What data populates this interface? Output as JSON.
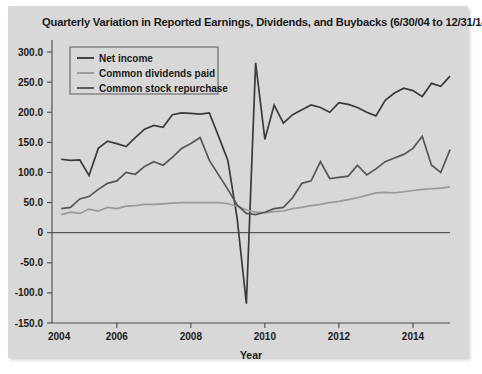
{
  "figure": {
    "background_color": "#ffffff",
    "card_color": "#d8d8d8"
  },
  "chart_data": {
    "type": "line",
    "title": "Quarterly Variation in Reported Earnings, Dividends, and Buybacks (6/30/04 to 12/31/14)",
    "xlabel": "Year",
    "ylabel": "",
    "xlim": [
      2004.25,
      2015.0
    ],
    "ylim": [
      -150,
      320
    ],
    "grid": false,
    "legend_position": "upper left",
    "xticks": [
      2004,
      2006,
      2008,
      2010,
      2012,
      2014
    ],
    "xticklabels": [
      "2004",
      "2006",
      "2008",
      "2010",
      "2012",
      "2014"
    ],
    "yticks": [
      -150,
      -100,
      -50,
      0,
      50,
      100,
      150,
      200,
      250,
      300
    ],
    "yticklabels": [
      "-150.0",
      "-100.0",
      "-50.0",
      "0",
      "50.0",
      "100.0",
      "150.0",
      "200.0",
      "250.0",
      "300.0"
    ],
    "zero_reference_line": 0,
    "x": [
      2004.5,
      2004.75,
      2005.0,
      2005.25,
      2005.5,
      2005.75,
      2006.0,
      2006.25,
      2006.5,
      2006.75,
      2007.0,
      2007.25,
      2007.5,
      2007.75,
      2008.0,
      2008.25,
      2008.5,
      2008.75,
      2009.0,
      2009.25,
      2009.5,
      2009.75,
      2010.0,
      2010.25,
      2010.5,
      2010.75,
      2011.0,
      2011.25,
      2011.5,
      2011.75,
      2012.0,
      2012.25,
      2012.5,
      2012.75,
      2013.0,
      2013.25,
      2013.5,
      2013.75,
      2014.0,
      2014.25,
      2014.5,
      2014.75,
      2015.0
    ],
    "series": [
      {
        "name": "Net income",
        "color": "#3a3a3a",
        "values": [
          122,
          120,
          121,
          95,
          140,
          152,
          148,
          143,
          158,
          172,
          178,
          175,
          196,
          199,
          198,
          197,
          199,
          160,
          120,
          24,
          -118,
          282,
          155,
          212,
          182,
          196,
          204,
          212,
          208,
          200,
          216,
          213,
          208,
          200,
          194,
          220,
          232,
          240,
          236,
          226,
          248,
          243,
          260
        ]
      },
      {
        "name": "Common dividends paid",
        "color": "#9a9a9a",
        "values": [
          30,
          34,
          32,
          39,
          36,
          42,
          40,
          44,
          45,
          47,
          47,
          48,
          49,
          50,
          50,
          50,
          50,
          50,
          48,
          44,
          38,
          34,
          33,
          35,
          36,
          40,
          42,
          45,
          47,
          50,
          52,
          55,
          58,
          62,
          66,
          67,
          66,
          68,
          70,
          72,
          73,
          74,
          76
        ]
      },
      {
        "name": "Common stock repurchase",
        "color": "#555555",
        "values": [
          40,
          42,
          56,
          60,
          72,
          82,
          86,
          100,
          97,
          110,
          118,
          112,
          125,
          140,
          148,
          158,
          120,
          96,
          72,
          46,
          32,
          30,
          34,
          40,
          42,
          58,
          82,
          86,
          118,
          90,
          92,
          94,
          112,
          96,
          106,
          118,
          124,
          130,
          140,
          160,
          112,
          100,
          138
        ]
      }
    ]
  },
  "legend": {
    "items": [
      {
        "label": "Net income",
        "color": "#3a3a3a"
      },
      {
        "label": "Common dividends paid",
        "color": "#9a9a9a"
      },
      {
        "label": "Common stock repurchase",
        "color": "#555555"
      }
    ]
  }
}
